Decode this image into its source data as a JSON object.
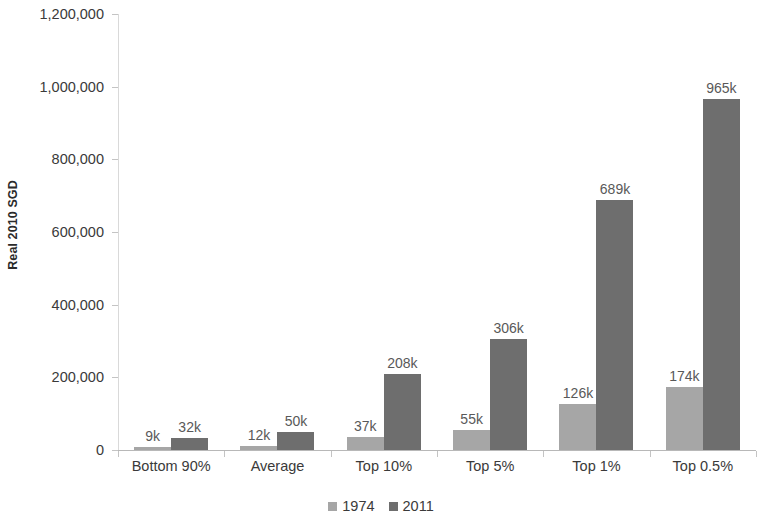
{
  "chart_data": {
    "type": "bar",
    "title": "",
    "subtitle": "",
    "xlabel": "",
    "ylabel": "Real 2010 SGD",
    "categories": [
      "Bottom 90%",
      "Average",
      "Top 10%",
      "Top 5%",
      "Top 1%",
      "Top 0.5%"
    ],
    "series": [
      {
        "name": "1974",
        "color": "#a6a6a6",
        "values": [
          9000,
          12000,
          37000,
          55000,
          126000,
          174000
        ],
        "labels": [
          "9k",
          "12k",
          "37k",
          "55k",
          "126k",
          "174k"
        ]
      },
      {
        "name": "2011",
        "color": "#6e6e6e",
        "values": [
          32000,
          50000,
          208000,
          306000,
          689000,
          965000
        ],
        "labels": [
          "32k",
          "50k",
          "208k",
          "306k",
          "689k",
          "965k"
        ]
      }
    ],
    "ylim": [
      0,
      1200000
    ],
    "ytick_values": [
      0,
      200000,
      400000,
      600000,
      800000,
      1000000,
      1200000
    ],
    "ytick_labels": [
      "0",
      "200,000",
      "400,000",
      "600,000",
      "800,000",
      "1,000,000",
      "1,200,000"
    ],
    "grid": false,
    "legend_position": "bottom-center",
    "legend_entries": [
      {
        "label": "1974",
        "color": "#a6a6a6"
      },
      {
        "label": "2011",
        "color": "#6e6e6e"
      }
    ],
    "units": "SGD",
    "value_label_suffix": "k"
  }
}
